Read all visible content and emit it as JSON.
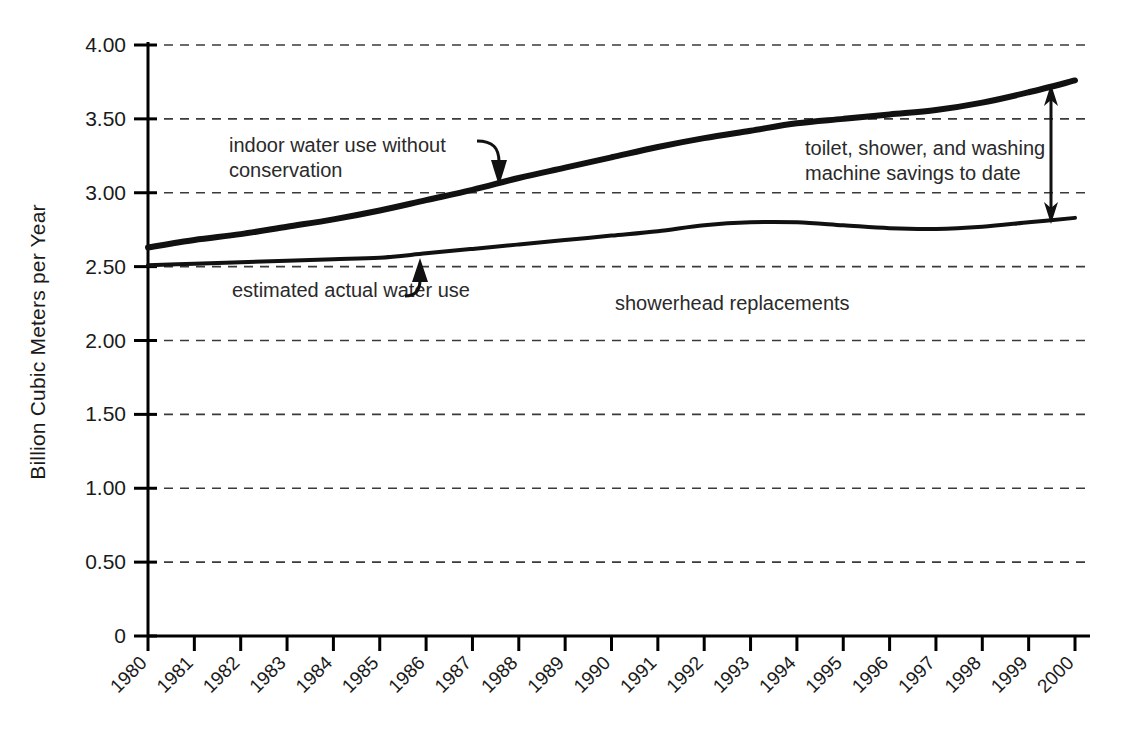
{
  "chart_data": {
    "type": "line",
    "title": "",
    "xlabel": "",
    "ylabel": "Billion Cubic Meters per Year",
    "xlim": [
      1980,
      2000
    ],
    "ylim": [
      0,
      4.0
    ],
    "grid": true,
    "legend_position": "inline-annotations",
    "x": [
      1980,
      1981,
      1982,
      1983,
      1984,
      1985,
      1986,
      1987,
      1988,
      1989,
      1990,
      1991,
      1992,
      1993,
      1994,
      1995,
      1996,
      1997,
      1998,
      1999,
      2000
    ],
    "categories": [
      "1980",
      "1981",
      "1982",
      "1983",
      "1984",
      "1985",
      "1986",
      "1987",
      "1988",
      "1989",
      "1990",
      "1991",
      "1992",
      "1993",
      "1994",
      "1995",
      "1996",
      "1997",
      "1998",
      "1999",
      "2000"
    ],
    "ytick_labels": [
      "4.00",
      "3.50",
      "3.00",
      "2.50",
      "2.00",
      "1.50",
      "1.00",
      "0.50",
      "0"
    ],
    "ytick_values": [
      4.0,
      3.5,
      3.0,
      2.5,
      2.0,
      1.5,
      1.0,
      0.5,
      0
    ],
    "series": [
      {
        "name": "indoor water use without conservation",
        "values": [
          2.63,
          2.68,
          2.72,
          2.77,
          2.82,
          2.88,
          2.95,
          3.02,
          3.1,
          3.17,
          3.24,
          3.31,
          3.37,
          3.42,
          3.47,
          3.5,
          3.53,
          3.56,
          3.61,
          3.68,
          3.76
        ]
      },
      {
        "name": "estimated actual water use",
        "values": [
          2.51,
          2.52,
          2.53,
          2.54,
          2.55,
          2.56,
          2.59,
          2.62,
          2.65,
          2.68,
          2.71,
          2.74,
          2.78,
          2.8,
          2.8,
          2.78,
          2.76,
          2.755,
          2.77,
          2.8,
          2.83
        ]
      }
    ],
    "annotations": [
      {
        "name": "indoor-water-use-label",
        "lines": [
          "indoor water use without",
          "conservation"
        ],
        "arrow": "curved-down"
      },
      {
        "name": "estimated-actual-label",
        "lines": [
          "estimated actual water use"
        ],
        "arrow": "curved-up"
      },
      {
        "name": "savings-label",
        "lines": [
          "toilet, shower, and washing",
          "machine savings to date"
        ],
        "arrow": "double-vertical"
      },
      {
        "name": "showerhead-label",
        "lines": [
          "showerhead replacements"
        ],
        "arrow": "none"
      }
    ],
    "colors": {
      "line": "#111111",
      "grid": "#3a3a3a",
      "axis": "#000000",
      "text": "#1a1a1a",
      "background": "#ffffff"
    }
  }
}
